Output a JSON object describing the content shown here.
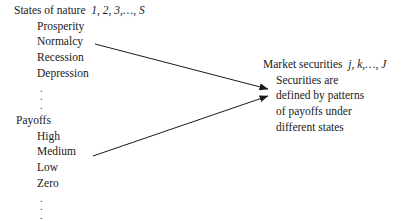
{
  "figure": {
    "background_color": "#ffffff",
    "line_color": "#1a1a1a"
  },
  "states_of_nature": {
    "heading_text": "States of nature",
    "heading_index": "1, 2, 3,…, S",
    "items": [
      "Prosperity",
      "Normalcy",
      "Recession",
      "Depression"
    ],
    "ellipsis": "⋮"
  },
  "payoffs": {
    "heading_text": "Payoffs",
    "heading_index": "",
    "items": [
      "High",
      "Medium",
      "Low",
      "Zero"
    ],
    "ellipsis": "⋮"
  },
  "market_securities": {
    "heading_text": "Market securities",
    "heading_index": "j, k,…, J",
    "items": [
      "Securities are",
      "defined by patterns",
      "of payoffs under",
      "different states"
    ]
  },
  "arrows": [
    {
      "name": "states-to-securities",
      "from_label": "Normalcy",
      "to_label": "Market securities",
      "x1": 95,
      "y1": 44,
      "x2": 268,
      "y2": 89
    },
    {
      "name": "payoffs-to-securities",
      "from_label": "Medium",
      "to_label": "Market securities",
      "x1": 93,
      "y1": 156,
      "x2": 268,
      "y2": 96
    }
  ]
}
